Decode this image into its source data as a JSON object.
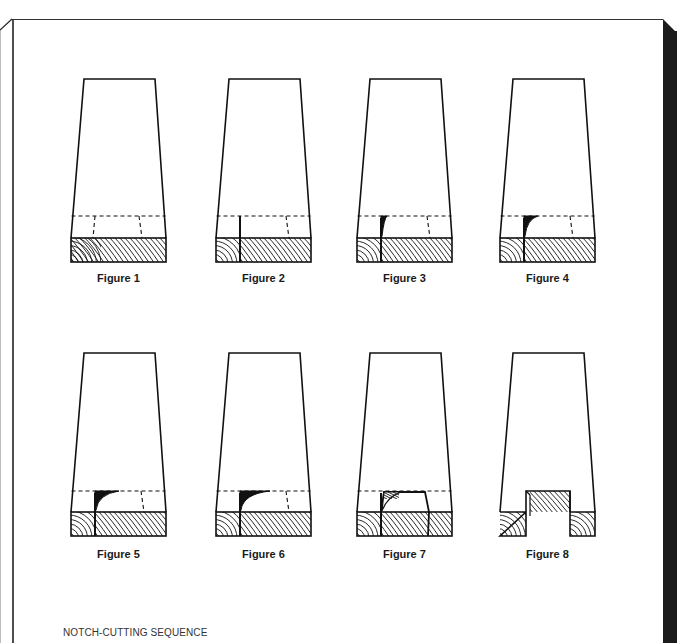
{
  "page": {
    "caption": "NOTCH-CUTTING SEQUENCE",
    "colors": {
      "ink": "#111111",
      "frame_bar": "#1c1c1c",
      "paper": "#ffffff",
      "caption": "#333333"
    }
  },
  "figures": [
    {
      "label": "Figure 1",
      "step": 1,
      "col": 0,
      "row": 0,
      "desc": "marked block with dashed notch layout"
    },
    {
      "label": "Figure 2",
      "step": 2,
      "col": 1,
      "row": 0,
      "desc": "first saw kerf on left notch line"
    },
    {
      "label": "Figure 3",
      "step": 3,
      "col": 2,
      "row": 0,
      "desc": "chisel begins removing wood at kerf"
    },
    {
      "label": "Figure 4",
      "step": 4,
      "col": 3,
      "row": 0,
      "desc": "chip removal deepens"
    },
    {
      "label": "Figure 5",
      "step": 5,
      "col": 0,
      "row": 1,
      "desc": "chip removed further toward center"
    },
    {
      "label": "Figure 6",
      "step": 6,
      "col": 1,
      "row": 1,
      "desc": "chip removal approaches right line"
    },
    {
      "label": "Figure 7",
      "step": 7,
      "col": 2,
      "row": 1,
      "desc": "both kerfs cut, waste loosened"
    },
    {
      "label": "Figure 8",
      "step": 8,
      "col": 3,
      "row": 1,
      "desc": "finished notch"
    }
  ]
}
